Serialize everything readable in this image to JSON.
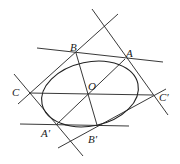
{
  "diagram": {
    "stroke": "#222222",
    "ellipse": {
      "cx": 90,
      "cy": 94,
      "rx": 49,
      "ry": 32,
      "rotate": -12
    },
    "points": {
      "A": {
        "label": "A",
        "x": 125,
        "y": 59
      },
      "B": {
        "label": "B",
        "x": 76,
        "y": 53
      },
      "C": {
        "label": "C",
        "x": 29,
        "y": 93
      },
      "O": {
        "label": "O",
        "x": 88,
        "y": 94
      },
      "Cp": {
        "label": "C′",
        "x": 153,
        "y": 95
      },
      "Ap": {
        "label": "A′",
        "x": 57,
        "y": 124
      },
      "Bp": {
        "label": "B′",
        "x": 97,
        "y": 125
      }
    },
    "lines": [
      {
        "name": "tangent-at-B",
        "x1": 37,
        "y1": 48,
        "x2": 163,
        "y2": 62
      },
      {
        "name": "tangent-at-Bp",
        "x1": 20,
        "y1": 124,
        "x2": 129,
        "y2": 126
      },
      {
        "name": "tangent-at-A",
        "x1": 92,
        "y1": 9,
        "x2": 168,
        "y2": 115
      },
      {
        "name": "tangent-at-Ap",
        "x1": 14,
        "y1": 74,
        "x2": 83,
        "y2": 156
      },
      {
        "name": "line-C-top",
        "x1": 18,
        "y1": 104,
        "x2": 118,
        "y2": 14
      },
      {
        "name": "line-Cp-bottom",
        "x1": 58,
        "y1": 148,
        "x2": 166,
        "y2": 89
      },
      {
        "name": "line-CCp",
        "x1": 29,
        "y1": 93,
        "x2": 153,
        "y2": 95
      },
      {
        "name": "line-AAp",
        "x1": 57,
        "y1": 124,
        "x2": 125,
        "y2": 59
      },
      {
        "name": "line-BBp",
        "x1": 76,
        "y1": 53,
        "x2": 97,
        "y2": 125
      }
    ]
  }
}
